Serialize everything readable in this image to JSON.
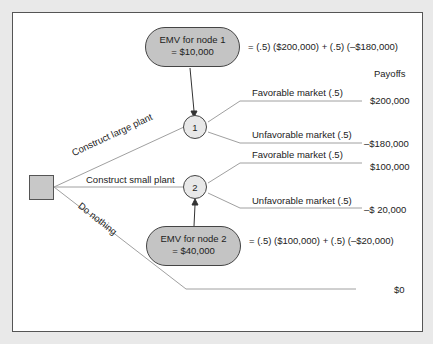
{
  "diagram": {
    "type": "decision-tree",
    "decision_node": {
      "shape": "square"
    },
    "branches": [
      {
        "label": "Construct large plant",
        "chance_node": "1"
      },
      {
        "label": "Construct small plant",
        "chance_node": "2"
      },
      {
        "label": "Do nothing",
        "payoff": "$0"
      }
    ],
    "chance_nodes": [
      {
        "id": "1",
        "emv_line1": "EMV for node 1",
        "emv_line2": "= $10,000",
        "formula": "= (.5) ($200,000) + (.5) (–$180,000)",
        "outcomes": [
          {
            "label": "Favorable market (.5)",
            "payoff": "$200,000"
          },
          {
            "label": "Unfavorable market (.5)",
            "payoff": "–$180,000"
          }
        ]
      },
      {
        "id": "2",
        "emv_line1": "EMV for node 2",
        "emv_line2": "= $40,000",
        "formula": "= (.5) ($100,000) + (.5) (–$20,000)",
        "outcomes": [
          {
            "label": "Favorable market (.5)",
            "payoff": "$100,000"
          },
          {
            "label": "Unfavorable market (.5)",
            "payoff": "–$ 20,000"
          }
        ]
      }
    ],
    "payoffs_header": "Payoffs",
    "do_nothing_payoff": "$0"
  },
  "colors": {
    "background": "#e9e9e9",
    "panel": "#ffffff",
    "shape_fill": "#c4c4c4",
    "node_fill": "#e8e8e8",
    "line": "#9a9a9a"
  }
}
